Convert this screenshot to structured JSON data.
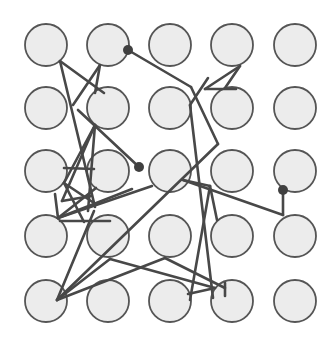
{
  "diagram": {
    "type": "node-grid-network",
    "grid": {
      "rows": 5,
      "cols": 5
    },
    "node_style": {
      "fill": "#ececec",
      "stroke": "#555555",
      "radius": 21
    },
    "edge_style": {
      "stroke": "#484848",
      "width": 2.6
    },
    "col_x": [
      46,
      108,
      170,
      232,
      295
    ],
    "row_y": [
      45,
      108,
      171,
      236,
      301
    ],
    "edges": [
      [
        [
          60,
          61
        ],
        [
          95,
          207
        ]
      ],
      [
        [
          60,
          61
        ],
        [
          104,
          93
        ]
      ],
      [
        [
          100,
          65
        ],
        [
          73,
          105
        ]
      ],
      [
        [
          100,
          65
        ],
        [
          95,
          93
        ]
      ],
      [
        [
          128,
          50
        ],
        [
          191,
          87
        ]
      ],
      [
        [
          191,
          87
        ],
        [
          218,
          144
        ]
      ],
      [
        [
          218,
          144
        ],
        [
          57,
          300
        ]
      ],
      [
        [
          205,
          89
        ],
        [
          236,
          89
        ]
      ],
      [
        [
          240,
          66
        ],
        [
          205,
          89
        ]
      ],
      [
        [
          240,
          66
        ],
        [
          225,
          88
        ]
      ],
      [
        [
          208,
          78
        ],
        [
          190,
          105
        ]
      ],
      [
        [
          190,
          105
        ],
        [
          213,
          298
        ]
      ],
      [
        [
          78,
          110
        ],
        [
          139,
          167
        ]
      ],
      [
        [
          95,
          125
        ],
        [
          64,
          183
        ]
      ],
      [
        [
          95,
          125
        ],
        [
          62,
          201
        ]
      ],
      [
        [
          95,
          125
        ],
        [
          88,
          211
        ]
      ],
      [
        [
          64,
          168
        ],
        [
          94,
          169
        ]
      ],
      [
        [
          64,
          183
        ],
        [
          94,
          203
        ]
      ],
      [
        [
          62,
          201
        ],
        [
          91,
          196
        ]
      ],
      [
        [
          64,
          183
        ],
        [
          84,
          222
        ]
      ],
      [
        [
          55,
          194
        ],
        [
          58,
          218
        ]
      ],
      [
        [
          58,
          218
        ],
        [
          132,
          189
        ]
      ],
      [
        [
          58,
          218
        ],
        [
          152,
          186
        ]
      ],
      [
        [
          96,
          188
        ],
        [
          58,
          218
        ]
      ],
      [
        [
          60,
          221
        ],
        [
          110,
          221
        ]
      ],
      [
        [
          94,
          211
        ],
        [
          57,
          300
        ]
      ],
      [
        [
          183,
          180
        ],
        [
          210,
          186
        ]
      ],
      [
        [
          183,
          180
        ],
        [
          283,
          215
        ]
      ],
      [
        [
          283,
          190
        ],
        [
          283,
          215
        ]
      ],
      [
        [
          210,
          186
        ],
        [
          190,
          300
        ]
      ],
      [
        [
          210,
          186
        ],
        [
          217,
          220
        ]
      ],
      [
        [
          110,
          259
        ],
        [
          215,
          288
        ]
      ],
      [
        [
          110,
          259
        ],
        [
          57,
          300
        ]
      ],
      [
        [
          57,
          300
        ],
        [
          165,
          258
        ]
      ],
      [
        [
          165,
          258
        ],
        [
          225,
          288
        ]
      ],
      [
        [
          188,
          294
        ],
        [
          215,
          288
        ]
      ],
      [
        [
          225,
          283
        ],
        [
          225,
          296
        ]
      ]
    ],
    "dots": [
      {
        "x": 128,
        "y": 50,
        "r": 5
      },
      {
        "x": 139,
        "y": 167,
        "r": 5
      },
      {
        "x": 283,
        "y": 190,
        "r": 5
      }
    ],
    "colors": {
      "background": "#ffffff",
      "dot": "#404040"
    }
  }
}
